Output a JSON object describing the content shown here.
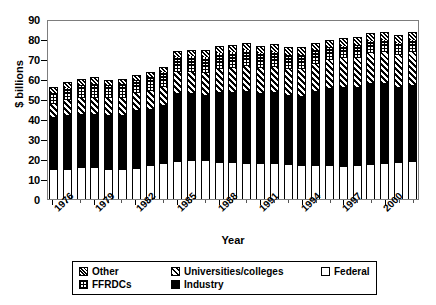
{
  "chart_data": {
    "type": "bar",
    "stacked": true,
    "title": "",
    "xlabel": "Year",
    "ylabel": "$ billions",
    "ylim": [
      0,
      90
    ],
    "ytick_step": 10,
    "yticks": [
      "0",
      "10",
      "20",
      "30",
      "40",
      "50",
      "60",
      "70",
      "80",
      "90"
    ],
    "grid": false,
    "legend_position": "bottom",
    "categories": [
      "1976",
      "1977",
      "1978",
      "1979",
      "1980",
      "1981",
      "1982",
      "1983",
      "1984",
      "1985",
      "1986",
      "1987",
      "1988",
      "1989",
      "1990",
      "1991",
      "1992",
      "1993",
      "1994",
      "1995",
      "1996",
      "1997",
      "1998",
      "1999",
      "2000",
      "2001",
      "2002"
    ],
    "xtick_labels": [
      "1976",
      "1979",
      "1982",
      "1985",
      "1988",
      "1991",
      "1994",
      "1997",
      "2000"
    ],
    "xtick_label_indices": [
      0,
      3,
      6,
      9,
      12,
      15,
      18,
      21,
      24
    ],
    "series": [
      {
        "name": "Federal",
        "pattern": "solid-white",
        "values": [
          15.0,
          14.8,
          15.8,
          15.8,
          15.0,
          15.0,
          15.3,
          17.0,
          17.8,
          18.9,
          19.7,
          19.3,
          18.6,
          18.3,
          18.2,
          18.0,
          17.8,
          17.5,
          17.2,
          17.0,
          16.8,
          16.6,
          17.0,
          17.5,
          18.0,
          18.6,
          19.2
        ]
      },
      {
        "name": "Industry",
        "pattern": "solid-black",
        "values": [
          26.0,
          27.4,
          26.8,
          26.9,
          27.2,
          27.0,
          29.0,
          28.2,
          29.0,
          34.1,
          33.1,
          32.8,
          34.8,
          35.2,
          36.0,
          34.9,
          35.5,
          34.3,
          34.5,
          36.8,
          38.6,
          39.5,
          39.0,
          40.3,
          40.0,
          37.4,
          38.0
        ]
      },
      {
        "name": "Universities/colleges",
        "pattern": "diagonal-stripes",
        "values": [
          6.5,
          7.2,
          7.8,
          8.0,
          8.4,
          8.5,
          8.6,
          8.9,
          9.3,
          10.5,
          10.8,
          11.1,
          11.6,
          12.0,
          12.4,
          12.6,
          12.9,
          13.1,
          13.4,
          13.6,
          13.9,
          14.2,
          14.7,
          15.0,
          15.5,
          16.0,
          16.5
        ]
      },
      {
        "name": "FFRDCs",
        "pattern": "checkered",
        "values": [
          5.5,
          6.1,
          6.4,
          6.6,
          6.4,
          6.8,
          6.6,
          6.9,
          7.2,
          7.6,
          7.9,
          8.0,
          8.2,
          8.0,
          7.9,
          7.7,
          7.5,
          7.3,
          7.1,
          6.9,
          6.6,
          6.4,
          6.3,
          6.2,
          6.1,
          6.0,
          5.9
        ]
      },
      {
        "name": "Other",
        "pattern": "dense-hatch",
        "values": [
          3.0,
          3.2,
          3.4,
          3.5,
          2.5,
          2.6,
          2.5,
          2.5,
          2.7,
          2.9,
          3.1,
          3.3,
          3.4,
          3.4,
          3.5,
          3.5,
          3.6,
          3.6,
          3.6,
          3.6,
          3.7,
          3.7,
          3.8,
          3.9,
          4.0,
          4.0,
          4.1
        ]
      }
    ]
  },
  "legend": {
    "row1": [
      {
        "label": "Other",
        "pattern": "dense-hatch"
      },
      {
        "label": "Universities/colleges",
        "pattern": "diagonal-stripes"
      },
      {
        "label": "Federal",
        "pattern": "solid-white"
      }
    ],
    "row2": [
      {
        "label": "FFRDCs",
        "pattern": "checkered"
      },
      {
        "label": "Industry",
        "pattern": "solid-black"
      }
    ]
  }
}
